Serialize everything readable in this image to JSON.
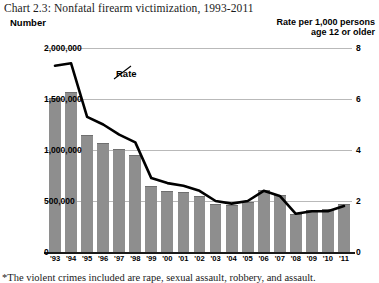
{
  "title": "Chart 2.3:  Nonfatal firearm victimization, 1993-2011",
  "axis_titles": {
    "left": "Number",
    "right_line1": "Rate per 1,000 persons",
    "right_line2": "age 12 or older"
  },
  "series_label": "Rate",
  "footnote": "*The violent crimes included are rape, sexual assault, robbery, and assault.",
  "colors": {
    "bar_fill": "#8e8e8e",
    "bar_edge": "#6f6f6f",
    "line": "#000000",
    "grid": "#b9b9b9",
    "axis": "#1a1a1a",
    "text": "#111111",
    "background": "#ffffff"
  },
  "chart_data": {
    "type": "bar",
    "title": "Chart 2.3:  Nonfatal firearm victimization, 1993-2011",
    "subtitle": "",
    "xlabel": "",
    "ylabel": "Number",
    "y2label": "Rate per 1,000 persons age 12 or older",
    "grid": true,
    "legend_position": "inline-annotation",
    "categories": [
      "'93",
      "'94",
      "'95",
      "'96",
      "'97",
      "'98",
      "'99",
      "'00",
      "'01",
      "'02",
      "'03",
      "'04",
      "'05",
      "'06",
      "'07",
      "'08",
      "'09",
      "'10",
      "'11"
    ],
    "ylim": [
      0,
      2000000
    ],
    "yticks": [
      0,
      500000,
      1000000,
      1500000,
      2000000
    ],
    "ytick_labels": [
      "0",
      "500,000",
      "1,000,000",
      "1,500,000",
      "2,000,000"
    ],
    "y2lim": [
      0,
      8
    ],
    "y2ticks": [
      0,
      2,
      4,
      6,
      8
    ],
    "y2tick_labels": [
      "0",
      "2",
      "4",
      "6",
      "8"
    ],
    "series": [
      {
        "name": "Number",
        "type": "bar",
        "axis": "left",
        "values": [
          1510000,
          1570000,
          1150000,
          1070000,
          1010000,
          950000,
          650000,
          600000,
          590000,
          550000,
          475000,
          460000,
          490000,
          610000,
          560000,
          370000,
          410000,
          420000,
          470000
        ]
      },
      {
        "name": "Rate",
        "type": "line",
        "axis": "right",
        "values": [
          7.3,
          7.4,
          5.3,
          5.0,
          4.6,
          4.3,
          2.9,
          2.7,
          2.6,
          2.4,
          2.0,
          1.9,
          2.0,
          2.4,
          2.2,
          1.5,
          1.6,
          1.6,
          1.8
        ]
      }
    ]
  }
}
